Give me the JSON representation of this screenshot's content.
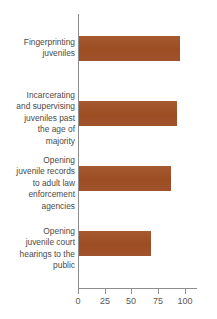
{
  "chart_data": {
    "type": "bar",
    "orientation": "horizontal",
    "title": "",
    "subtitle": "",
    "xlabel": "",
    "ylabel": "",
    "categories": [
      "Fingerprinting juveniles",
      "Incarcerating and supervising juveniles past the age of majority",
      "Opening juvenile records to adult law enforcement agencies",
      "Opening juvenile court hearings to the public"
    ],
    "category_lines": [
      [
        "Fingerprinting",
        "juveniles"
      ],
      [
        "Incarcerating",
        "and supervising",
        "juveniles past",
        "the age of",
        "majority"
      ],
      [
        "Opening",
        "juvenile records",
        "to adult law",
        "enforcement",
        "agencies"
      ],
      [
        "Opening",
        "juvenile court",
        "hearings to the",
        "public"
      ]
    ],
    "values": [
      94,
      92,
      86,
      67
    ],
    "xlim": [
      0,
      100
    ],
    "xticks": [
      0,
      25,
      50,
      75,
      100
    ],
    "xtick_labels": [
      "0",
      "25",
      "50",
      "75",
      "100"
    ],
    "grid": false,
    "legend": false,
    "bar_color": "#a0522d",
    "axis_color": "#8d8d8d",
    "text_color": "#4a4a4a",
    "background_color": "#ffffff"
  }
}
